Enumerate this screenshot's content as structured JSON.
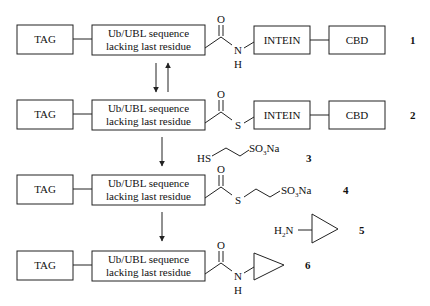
{
  "boxes": {
    "tag": "TAG",
    "ubl_line1": "Ub/UBL sequence",
    "ubl_line2": "lacking last residue",
    "intein": "INTEIN",
    "cbd": "CBD"
  },
  "atoms": {
    "oxygen": "O",
    "nitrogen": "N",
    "hydrogen": "H",
    "sulfur": "S",
    "thiol": "HS",
    "sulfonate": "SO",
    "sulfonate_sub": "3",
    "sulfonate_tail": "Na",
    "amine": "H",
    "amine_sub": "2",
    "amine_tail": "N"
  },
  "compounds": [
    {
      "label": "1",
      "description": "TAG–Ub/UBL(lacking last residue)–C(=O)NH–INTEIN–CBD"
    },
    {
      "label": "2",
      "description": "TAG–Ub/UBL(lacking last residue)–C(=O)S–INTEIN–CBD"
    },
    {
      "label": "3",
      "description": "HS–CH2CH2–SO3Na"
    },
    {
      "label": "4",
      "description": "TAG–Ub/UBL(lacking last residue)–C(=O)S–CH2CH2–SO3Na"
    },
    {
      "label": "5",
      "description": "H2N–cyclopropyl"
    },
    {
      "label": "6",
      "description": "TAG–Ub/UBL(lacking last residue)–C(=O)NH–cyclopropyl"
    }
  ]
}
